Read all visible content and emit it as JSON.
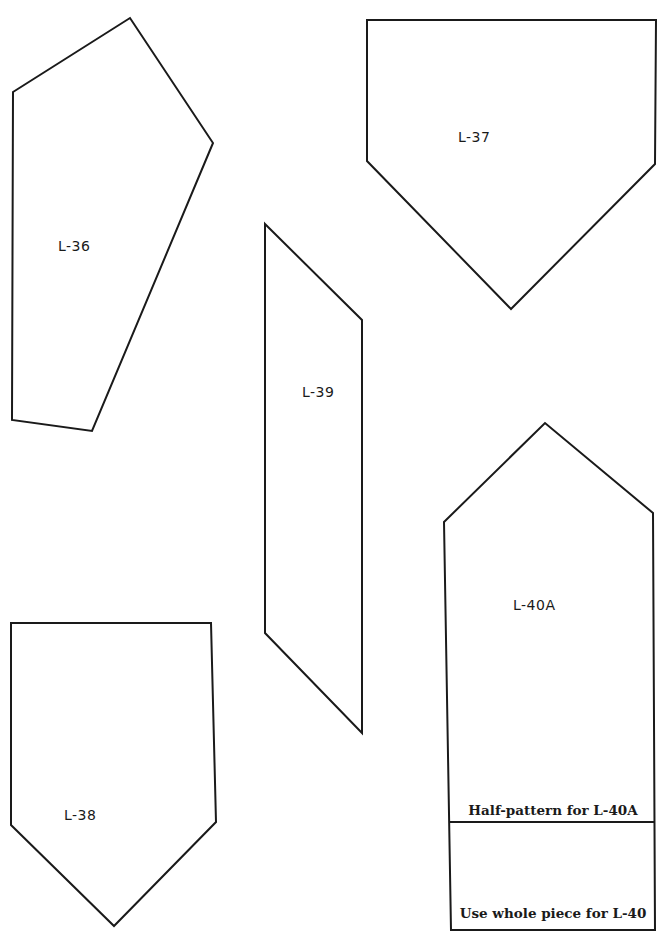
{
  "page": {
    "background": "#ffffff",
    "line_color": "#1a1a1a"
  },
  "pieces": [
    {
      "id": "L-36",
      "label": "L-36",
      "points": "13,92 130,18 213,143 92,431 12,420",
      "label_pos": {
        "x": 58,
        "y": 238
      }
    },
    {
      "id": "L-37",
      "label": "L-37",
      "points": "367,20 656,20 655,164 511,309 367,161",
      "label_pos": {
        "x": 458,
        "y": 129
      }
    },
    {
      "id": "L-39",
      "label": "L-39",
      "points": "265,224 362,320 362,733 265,633",
      "label_pos": {
        "x": 302,
        "y": 384
      }
    },
    {
      "id": "L-40A",
      "label": "L-40A",
      "points": "444,522 545,423 653,513 655,930 451,930",
      "label_pos": {
        "x": 513,
        "y": 597
      },
      "divider": {
        "x1": 449,
        "y1": 822,
        "x2": 655,
        "y2": 822
      },
      "notes": [
        {
          "text": "Half-pattern for L-40A",
          "x": 553,
          "y": 802
        },
        {
          "text": "Use whole piece for L-40",
          "x": 553,
          "y": 905
        }
      ]
    },
    {
      "id": "L-38",
      "label": "L-38",
      "points": "11,623 211,623 216,822 114,926 11,825",
      "label_pos": {
        "x": 64,
        "y": 807
      }
    }
  ]
}
